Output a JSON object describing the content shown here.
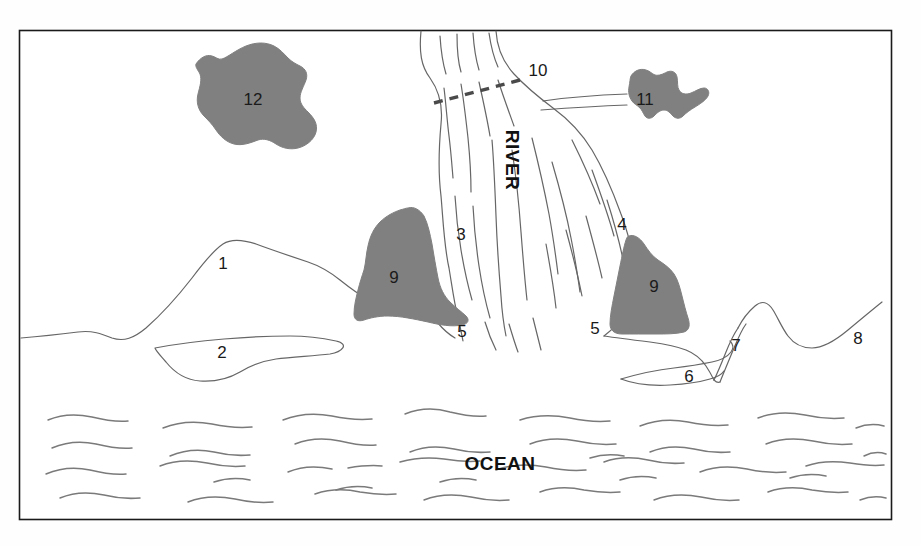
{
  "figure": {
    "title_text": "",
    "frame": {
      "x": 19,
      "y": 30,
      "width": 873,
      "height": 490
    },
    "colors": {
      "shaded_fill": "#808080",
      "line": "#555555",
      "frame_line": "#1a1a1a",
      "text": "#111111",
      "background": "#ffffff"
    }
  },
  "labels": {
    "river": "RIVER",
    "ocean": "OCEAN",
    "n1": "1",
    "n2": "2",
    "n3": "3",
    "n4": "4",
    "n5_left": "5",
    "n5_right": "5",
    "n6": "6",
    "n7": "7",
    "n8": "8",
    "n9_left": "9",
    "n9_right": "9",
    "n10": "10",
    "n11": "11",
    "n12": "12"
  },
  "regions": [
    {
      "id": "1",
      "label": "1",
      "kind": "outlined-landform",
      "shaded": false
    },
    {
      "id": "2",
      "label": "2",
      "kind": "outlined-landform",
      "shaded": false
    },
    {
      "id": "3",
      "label": "3",
      "kind": "river-channel-area",
      "shaded": false
    },
    {
      "id": "4",
      "label": "4",
      "kind": "river-channel-area",
      "shaded": false
    },
    {
      "id": "5a",
      "label": "5",
      "kind": "river-mouth",
      "shaded": false
    },
    {
      "id": "5b",
      "label": "5",
      "kind": "river-mouth",
      "shaded": false
    },
    {
      "id": "6",
      "label": "6",
      "kind": "outlined-landform",
      "shaded": false
    },
    {
      "id": "7",
      "label": "7",
      "kind": "outlined-landform",
      "shaded": false
    },
    {
      "id": "8",
      "label": "8",
      "kind": "open-land",
      "shaded": false
    },
    {
      "id": "9a",
      "label": "9",
      "kind": "shaded-polygon",
      "shaded": true
    },
    {
      "id": "9b",
      "label": "9",
      "kind": "shaded-polygon",
      "shaded": true
    },
    {
      "id": "10",
      "label": "10",
      "kind": "dashed-boundary",
      "shaded": false
    },
    {
      "id": "11",
      "label": "11",
      "kind": "shaded-polygon",
      "shaded": true
    },
    {
      "id": "12",
      "label": "12",
      "kind": "shaded-polygon",
      "shaded": true
    }
  ]
}
